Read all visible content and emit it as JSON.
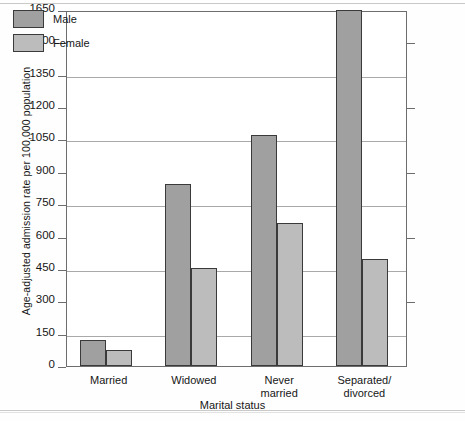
{
  "chart_data": {
    "type": "bar",
    "title": "",
    "xlabel": "Marital status",
    "ylabel": "Age-adjusted admission rate per 100,000 population",
    "categories": [
      "Married",
      "Widowed",
      "Never married",
      "Separated/ divorced"
    ],
    "category_labels": [
      "Married",
      "Widowed",
      "Never\nmarried",
      "Separated/\ndivorced"
    ],
    "series": [
      {
        "name": "Male",
        "color": "#a0a0a0",
        "values": [
          120,
          845,
          1070,
          1650
        ]
      },
      {
        "name": "Female",
        "color": "#bcbcbc",
        "values": [
          75,
          452,
          665,
          495
        ]
      }
    ],
    "ylim": [
      0,
      1650
    ],
    "ytick_values": [
      0,
      150,
      300,
      450,
      600,
      750,
      900,
      1050,
      1200,
      1350,
      1500,
      1650
    ],
    "ytick_labels": [
      "0",
      "150",
      "300",
      "450",
      "600",
      "750",
      "900",
      "1050",
      "1200",
      "1350",
      "1500",
      "1650"
    ],
    "gridlines_at": [
      150,
      450,
      750,
      1050,
      1350,
      1650
    ],
    "grid": true,
    "legend_position": "top-left"
  },
  "legend": {
    "entries": [
      {
        "label": "Male"
      },
      {
        "label": "Female"
      }
    ]
  },
  "axes": {
    "y_title": "Age-adjusted admission rate per 100,000 population",
    "x_title": "Marital status"
  }
}
